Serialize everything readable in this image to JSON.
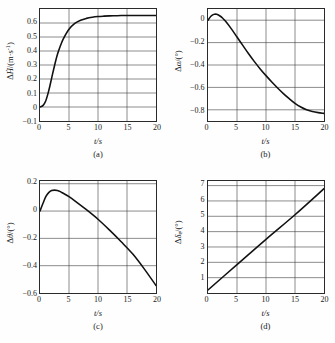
{
  "figure": {
    "panels": [
      {
        "id": "a",
        "caption": "(a)",
        "ylabel_html": "Δ<i>Ḣ</i>/(m·s<sup>-1</sup>)",
        "xlabel_html": "<i>t</i>/s"
      },
      {
        "id": "b",
        "caption": "(b)",
        "ylabel_html": "Δ<i>α</i>/(°)",
        "xlabel_html": "<i>t</i>/s"
      },
      {
        "id": "c",
        "caption": "(c)",
        "ylabel_html": "Δ<i>θ</i>/(°)",
        "xlabel_html": "<i>t</i>/s"
      },
      {
        "id": "d",
        "caption": "(d)",
        "ylabel_html": "Δ<i>δ</i><sub>e</sub>/(°)",
        "xlabel_html": "<i>t</i>/s"
      }
    ]
  },
  "chart_data": [
    {
      "type": "line",
      "panel": "a",
      "title": "",
      "xlabel": "t/s",
      "ylabel": "ΔḢ/(m·s⁻¹)",
      "xlim": [
        0,
        20
      ],
      "ylim": [
        -0.1,
        0.7
      ],
      "xticks": [
        0,
        5,
        10,
        15,
        20
      ],
      "yticks": [
        -0.1,
        0,
        0.1,
        0.2,
        0.3,
        0.4,
        0.5,
        0.6
      ],
      "ytick_labels": [
        "-0.1",
        "0",
        "0.1",
        "0.2",
        "0.3",
        "0.4",
        "0.5",
        "0.6"
      ],
      "grid": true,
      "legend": null,
      "x": [
        0,
        0.5,
        1,
        1.5,
        2,
        2.5,
        3,
        3.5,
        4,
        5,
        6,
        7,
        8,
        9,
        10,
        11,
        12,
        13,
        14,
        15,
        16,
        17,
        18,
        19,
        20
      ],
      "values": [
        0.0,
        0.01,
        0.045,
        0.115,
        0.205,
        0.295,
        0.375,
        0.435,
        0.485,
        0.555,
        0.597,
        0.62,
        0.633,
        0.641,
        0.646,
        0.649,
        0.651,
        0.652,
        0.653,
        0.653,
        0.654,
        0.654,
        0.654,
        0.654,
        0.654
      ]
    },
    {
      "type": "line",
      "panel": "b",
      "title": "",
      "xlabel": "t/s",
      "ylabel": "Δα/(°)",
      "xlim": [
        0,
        20
      ],
      "ylim": [
        -0.9,
        0.1
      ],
      "xticks": [
        0,
        5,
        10,
        15,
        20
      ],
      "yticks": [
        0,
        -0.2,
        -0.4,
        -0.6,
        -0.8
      ],
      "ytick_labels": [
        "0",
        "-0.2",
        "-0.4",
        "-0.6",
        "-0.8"
      ],
      "grid": true,
      "legend": null,
      "x": [
        0,
        0.5,
        1,
        1.5,
        2,
        2.5,
        3,
        4,
        5,
        6,
        7,
        8,
        9,
        10,
        11,
        12,
        13,
        14,
        15,
        16,
        17,
        18,
        19,
        20
      ],
      "values": [
        0.0,
        0.035,
        0.052,
        0.053,
        0.04,
        0.02,
        -0.008,
        -0.075,
        -0.15,
        -0.225,
        -0.3,
        -0.37,
        -0.435,
        -0.495,
        -0.552,
        -0.605,
        -0.655,
        -0.7,
        -0.742,
        -0.775,
        -0.8,
        -0.815,
        -0.825,
        -0.832
      ]
    },
    {
      "type": "line",
      "panel": "c",
      "title": "",
      "xlabel": "t/s",
      "ylabel": "Δθ/(°)",
      "xlim": [
        0,
        20
      ],
      "ylim": [
        -0.6,
        0.22
      ],
      "xticks": [
        0,
        5,
        10,
        15,
        20
      ],
      "yticks": [
        0.2,
        0,
        -0.2,
        -0.4,
        -0.6
      ],
      "ytick_labels": [
        "0.2",
        "0",
        "-0.2",
        "-0.4",
        "-0.6"
      ],
      "grid": true,
      "legend": null,
      "x": [
        0,
        0.5,
        1,
        1.5,
        2,
        2.5,
        3,
        3.5,
        4,
        5,
        6,
        8,
        10,
        12,
        14,
        16,
        18,
        20
      ],
      "values": [
        0.0,
        0.055,
        0.105,
        0.135,
        0.15,
        0.153,
        0.15,
        0.142,
        0.13,
        0.105,
        0.075,
        0.01,
        -0.06,
        -0.14,
        -0.225,
        -0.315,
        -0.425,
        -0.545
      ]
    },
    {
      "type": "line",
      "panel": "d",
      "title": "",
      "xlabel": "t/s",
      "ylabel": "Δδe/(°)",
      "xlim": [
        0,
        20
      ],
      "ylim": [
        0,
        7.3
      ],
      "xticks": [
        0,
        5,
        10,
        15,
        20
      ],
      "yticks": [
        1,
        2,
        3,
        4,
        5,
        6,
        7
      ],
      "ytick_labels": [
        "1",
        "2",
        "3",
        "4",
        "5",
        "6",
        "7"
      ],
      "grid": true,
      "legend": null,
      "x": [
        0,
        5,
        10,
        15,
        20
      ],
      "values": [
        0.2,
        1.85,
        3.5,
        5.1,
        6.8
      ]
    }
  ]
}
